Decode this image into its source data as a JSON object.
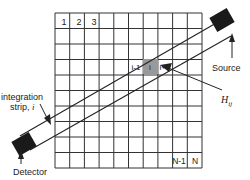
{
  "grid": {
    "rows": 10,
    "cols": 10,
    "x0": 55,
    "y0": 13,
    "x1": 202,
    "y1": 168,
    "line_color": "#333333",
    "cell_labels_top": [
      "1",
      "2",
      "3"
    ],
    "cell_labels_bottom": [
      "N-1",
      "N"
    ]
  },
  "highlight": {
    "cells": [
      "i-1",
      "i",
      "i+1"
    ],
    "fill": "#999999"
  },
  "labels": {
    "source": "Source",
    "detector": "Detector",
    "integration_strip_line1": "integration",
    "integration_strip_line2": "strip, ",
    "integration_strip_var": "i",
    "weight": "H",
    "weight_sub": "ij"
  },
  "colors": {
    "ink": "#222222",
    "block": "#1a1a1a",
    "background": "#ffffff"
  }
}
